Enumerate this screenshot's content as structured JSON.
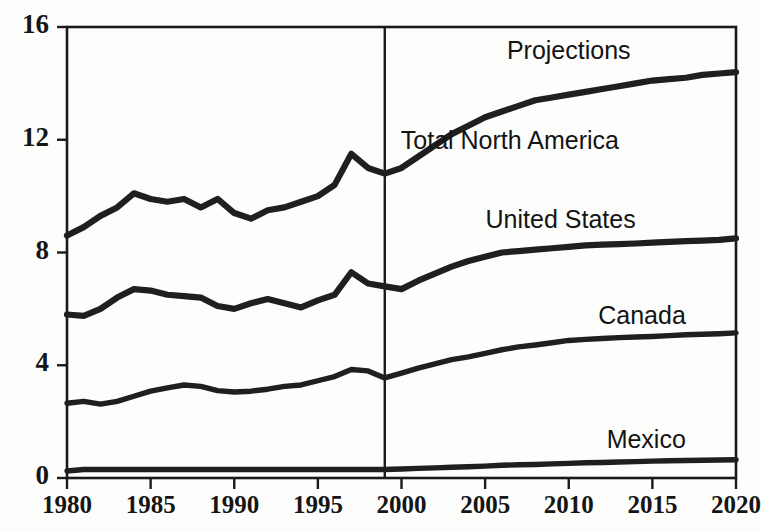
{
  "chart_data": {
    "type": "line",
    "title": "",
    "subtitle": "",
    "xlabel": "",
    "ylabel": "",
    "xlim": [
      1980,
      2020
    ],
    "ylim": [
      0,
      16
    ],
    "grid": false,
    "legend_position": "inline-right",
    "x_ticks": [
      "1980",
      "1985",
      "1990",
      "1995",
      "2000",
      "2005",
      "2010",
      "2015",
      "2020"
    ],
    "x_tick_values": [
      1980,
      1985,
      1990,
      1995,
      2000,
      2005,
      2010,
      2015,
      2020
    ],
    "y_ticks": [
      "0",
      "4",
      "8",
      "12",
      "16"
    ],
    "y_tick_values": [
      0,
      4,
      8,
      12,
      16
    ],
    "annotations": [
      {
        "text": "History",
        "x": 1899,
        "y": 15.1,
        "role": "period-history"
      },
      {
        "text": "Projections",
        "x": 2010,
        "y": 15.1,
        "role": "period-projections"
      }
    ],
    "divider": {
      "x": 1999,
      "label": "history-projection-divider"
    },
    "x": [
      1980,
      1981,
      1982,
      1983,
      1984,
      1985,
      1986,
      1987,
      1988,
      1989,
      1990,
      1991,
      1992,
      1993,
      1994,
      1995,
      1996,
      1997,
      1998,
      1999,
      2000,
      2001,
      2002,
      2003,
      2004,
      2005,
      2006,
      2007,
      2008,
      2009,
      2010,
      2011,
      2012,
      2013,
      2014,
      2015,
      2016,
      2017,
      2018,
      2019,
      2020
    ],
    "series": [
      {
        "name": "Total North America",
        "label_x": 2013,
        "label_y": 11.9,
        "values": [
          8.6,
          8.9,
          9.3,
          9.6,
          10.1,
          9.9,
          9.8,
          9.9,
          9.6,
          9.9,
          9.4,
          9.2,
          9.5,
          9.6,
          9.8,
          10.0,
          10.4,
          11.5,
          11.0,
          10.8,
          11.0,
          11.4,
          11.8,
          12.2,
          12.5,
          12.8,
          13.0,
          13.2,
          13.4,
          13.5,
          13.6,
          13.7,
          13.8,
          13.9,
          14.0,
          14.1,
          14.15,
          14.2,
          14.3,
          14.35,
          14.4
        ]
      },
      {
        "name": "United States",
        "label_x": 2014,
        "label_y": 9.1,
        "values": [
          5.8,
          5.75,
          6.0,
          6.4,
          6.7,
          6.65,
          6.5,
          6.45,
          6.4,
          6.1,
          6.0,
          6.2,
          6.35,
          6.2,
          6.05,
          6.3,
          6.5,
          7.3,
          6.9,
          6.8,
          6.7,
          7.0,
          7.25,
          7.5,
          7.7,
          7.85,
          8.0,
          8.05,
          8.1,
          8.15,
          8.2,
          8.25,
          8.28,
          8.3,
          8.32,
          8.35,
          8.38,
          8.4,
          8.42,
          8.45,
          8.5
        ]
      },
      {
        "name": "Canada",
        "label_x": 2017,
        "label_y": 5.7,
        "values": [
          2.65,
          2.72,
          2.62,
          2.72,
          2.9,
          3.08,
          3.2,
          3.3,
          3.25,
          3.1,
          3.05,
          3.08,
          3.15,
          3.25,
          3.3,
          3.45,
          3.6,
          3.85,
          3.8,
          3.55,
          3.72,
          3.9,
          4.05,
          4.2,
          4.3,
          4.42,
          4.55,
          4.65,
          4.72,
          4.8,
          4.88,
          4.92,
          4.95,
          4.98,
          5.0,
          5.02,
          5.05,
          5.08,
          5.1,
          5.12,
          5.15
        ]
      },
      {
        "name": "Mexico",
        "label_x": 2017,
        "label_y": 1.3,
        "values": [
          0.25,
          0.3,
          0.3,
          0.3,
          0.3,
          0.3,
          0.3,
          0.3,
          0.3,
          0.3,
          0.3,
          0.3,
          0.3,
          0.3,
          0.3,
          0.3,
          0.3,
          0.3,
          0.3,
          0.3,
          0.32,
          0.34,
          0.36,
          0.38,
          0.4,
          0.42,
          0.45,
          0.47,
          0.48,
          0.5,
          0.52,
          0.54,
          0.55,
          0.57,
          0.58,
          0.6,
          0.61,
          0.62,
          0.63,
          0.64,
          0.65
        ]
      }
    ]
  }
}
